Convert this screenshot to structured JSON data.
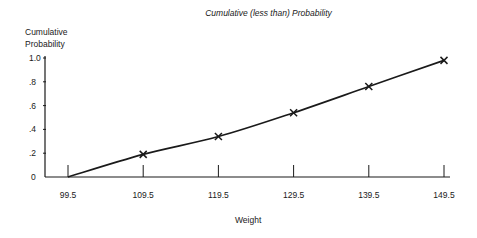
{
  "chart_data": {
    "type": "line",
    "title": "Cumulative (less than) Probability",
    "xlabel": "Weight",
    "ylabel": "Cumulative Probability",
    "x": [
      99.5,
      109.5,
      119.5,
      129.5,
      139.5,
      149.5
    ],
    "series": [
      {
        "name": "Cumulative (less than) Probability",
        "values": [
          0.0,
          0.19,
          0.34,
          0.54,
          0.76,
          0.98
        ],
        "marker": "x"
      }
    ],
    "xticks": [
      "99.5",
      "109.5",
      "119.5",
      "129.5",
      "139.5",
      "149.5"
    ],
    "yticks": [
      "0",
      ".2",
      ".4",
      ".6",
      ".8",
      "1.0"
    ],
    "ylim": [
      0,
      1.0
    ],
    "xlim": [
      99.5,
      149.5
    ],
    "grid": false,
    "legend": null
  },
  "labels": {
    "title": "Cumulative (less than) Probability",
    "ylabel_line1": "Cumulative",
    "ylabel_line2": "Probability",
    "xlabel": "Weight"
  },
  "colors": {
    "ink": "#1a1a1a",
    "background": "#ffffff"
  }
}
